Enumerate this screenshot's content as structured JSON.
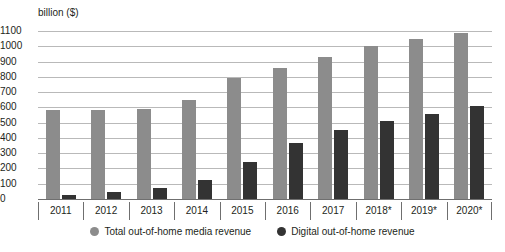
{
  "chart_data": {
    "type": "bar",
    "title": "",
    "subtitle": "",
    "xlabel": "",
    "ylabel": "billion ($)",
    "ylim": [
      0,
      1100
    ],
    "ytick_step": 100,
    "yticks": [
      1100,
      1000,
      900,
      800,
      700,
      600,
      500,
      400,
      300,
      200,
      100,
      0
    ],
    "grid": true,
    "legend_position": "bottom",
    "categories": [
      "2011",
      "2012",
      "2013",
      "2014",
      "2015",
      "2016",
      "2017",
      "2018*",
      "2019*",
      "2020*"
    ],
    "series": [
      {
        "name": "Total out-of-home media revenue",
        "color": "#8c8c8c",
        "values": [
          580,
          580,
          590,
          650,
          790,
          855,
          930,
          1000,
          1045,
          1090
        ]
      },
      {
        "name": "Digital out-of-home revenue",
        "color": "#333333",
        "values": [
          25,
          45,
          75,
          125,
          240,
          370,
          455,
          510,
          555,
          610
        ]
      }
    ]
  },
  "colors": {
    "total": "#8c8c8c",
    "digital": "#333333",
    "gridline": "#b9b9b9",
    "axis": "#6f6f6f",
    "text": "#231f20",
    "background": "#ffffff"
  }
}
